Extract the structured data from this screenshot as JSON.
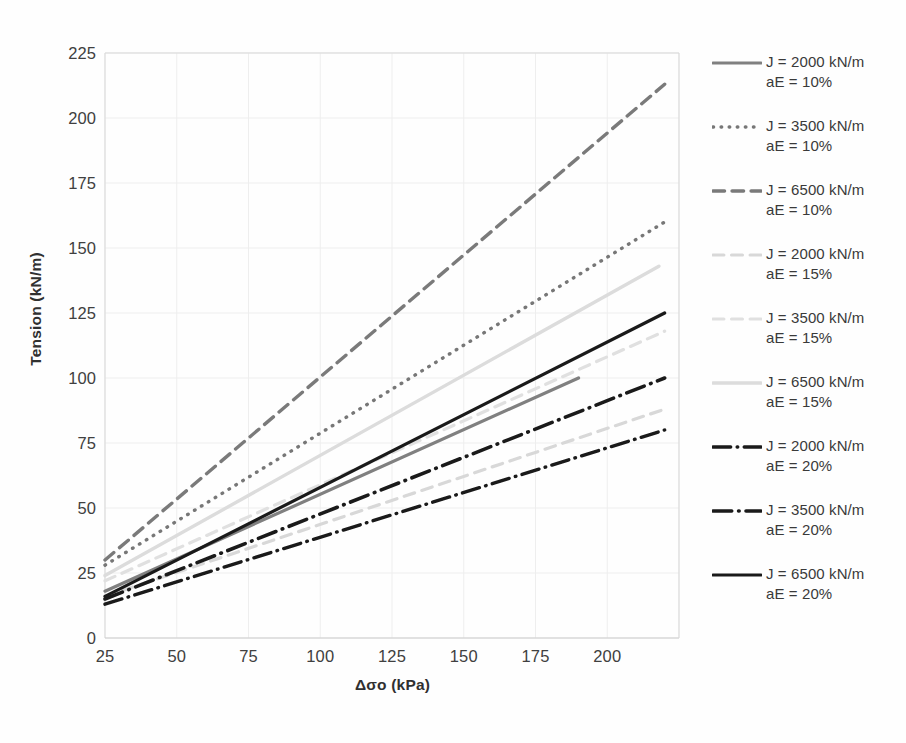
{
  "chart_data": {
    "type": "line",
    "title": "",
    "xlabel": "Δσo (kPa)",
    "ylabel": "Tension (kN/m)",
    "xlim": [
      25,
      225
    ],
    "ylim": [
      0,
      225
    ],
    "xticks": [
      25,
      50,
      75,
      100,
      125,
      150,
      175,
      200
    ],
    "yticks": [
      0,
      25,
      50,
      75,
      100,
      125,
      150,
      175,
      200,
      225
    ],
    "grid": true,
    "legend_position": "right",
    "series": [
      {
        "name": "J = 2000 kN/m\naE = 10%",
        "J": 2000,
        "aE": "10%",
        "style": "solid",
        "color": "#808080",
        "width": 3.2,
        "x": [
          25,
          190
        ],
        "y": [
          18,
          100
        ]
      },
      {
        "name": "J = 3500 kN/m\naE = 10%",
        "J": 3500,
        "aE": "10%",
        "style": "dotted",
        "color": "#777777",
        "width": 3.4,
        "x": [
          25,
          220
        ],
        "y": [
          28,
          160
        ]
      },
      {
        "name": "J = 6500 kN/m\naE = 10%",
        "J": 6500,
        "aE": "10%",
        "style": "dashed",
        "color": "#7a7a7a",
        "width": 3.4,
        "x": [
          25,
          220
        ],
        "y": [
          30,
          213
        ]
      },
      {
        "name": "J = 2000 kN/m\naE = 15%",
        "J": 2000,
        "aE": "15%",
        "style": "dashed-faint",
        "color": "#d8d8d8",
        "width": 3.2,
        "x": [
          25,
          220
        ],
        "y": [
          16,
          88
        ]
      },
      {
        "name": "J = 3500 kN/m\naE = 15%",
        "J": 3500,
        "aE": "15%",
        "style": "dashed-faint",
        "color": "#e0e0e0",
        "width": 3.2,
        "x": [
          25,
          220
        ],
        "y": [
          22,
          118
        ]
      },
      {
        "name": "J = 6500 kN/m\naE = 15%",
        "J": 6500,
        "aE": "15%",
        "style": "solid-faint",
        "color": "#dcdcdc",
        "width": 3.4,
        "x": [
          25,
          218
        ],
        "y": [
          24,
          143
        ]
      },
      {
        "name": "J = 2000 kN/m\naE = 20%",
        "J": 2000,
        "aE": "20%",
        "style": "dashdot",
        "color": "#1a1a1a",
        "width": 3.4,
        "x": [
          25,
          220
        ],
        "y": [
          13,
          80
        ]
      },
      {
        "name": "J = 3500 kN/m\naE = 20%",
        "J": 3500,
        "aE": "20%",
        "style": "dashdot",
        "color": "#1a1a1a",
        "width": 3.6,
        "x": [
          25,
          220
        ],
        "y": [
          15,
          100
        ]
      },
      {
        "name": "J = 6500 kN/m\naE = 20%",
        "J": 6500,
        "aE": "20%",
        "style": "solid",
        "color": "#1a1a1a",
        "width": 3.2,
        "x": [
          25,
          220
        ],
        "y": [
          16,
          125
        ]
      }
    ]
  },
  "axes": {
    "y_label": "Tension (kN/m)",
    "x_label": "Δσo (kPa)",
    "y_ticks": [
      "225",
      "200",
      "175",
      "150",
      "125",
      "100",
      "75",
      "50",
      "25",
      "0"
    ],
    "x_ticks": [
      "25",
      "50",
      "75",
      "100",
      "125",
      "150",
      "175",
      "200"
    ]
  },
  "legend": {
    "items": [
      {
        "label": "J = 2000 kN/m\naE = 10%",
        "swatch": "line-solid-gray"
      },
      {
        "label": "J = 3500 kN/m\naE = 10%",
        "swatch": "line-dotted-gray"
      },
      {
        "label": "J = 6500 kN/m\naE = 10%",
        "swatch": "line-dashed-gray"
      },
      {
        "label": "J = 2000 kN/m\naE = 15%",
        "swatch": "line-dashed-faint"
      },
      {
        "label": "J = 3500 kN/m\naE = 15%",
        "swatch": "line-dashed-faint"
      },
      {
        "label": "J = 6500 kN/m\naE = 15%",
        "swatch": "line-solid-faint"
      },
      {
        "label": "J = 2000 kN/m\naE = 20%",
        "swatch": "line-dashdot-black"
      },
      {
        "label": "J = 3500 kN/m\naE = 20%",
        "swatch": "line-dashdot-black"
      },
      {
        "label": "J = 6500 kN/m\naE = 20%",
        "swatch": "line-solid-black"
      }
    ]
  },
  "colors": {
    "grid": "#eeeeee",
    "axis": "#d9d9d9",
    "text": "#3f3f3f",
    "gray_series": "#7a7a7a",
    "faint_series": "#dcdcdc",
    "black_series": "#1a1a1a"
  }
}
